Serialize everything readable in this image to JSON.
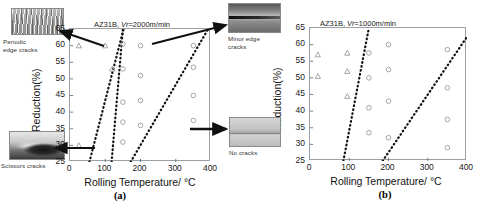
{
  "figure": {
    "panels": [
      {
        "id": "a",
        "caption": "(a)",
        "title_prefix": "AZ31B, ",
        "title_var": "Vr",
        "title_suffix": "=2000m/min",
        "title_full": "AZ31B, Vr=2000m/min"
      },
      {
        "id": "b",
        "caption": "(b)",
        "title_prefix": "AZ31B, ",
        "title_var": "Vr",
        "title_suffix": "=1000m/min",
        "title_full": "AZ31B, Vr=1000m/min"
      }
    ],
    "insets": [
      {
        "key": "periodic",
        "label": "Periodic\nedge cracks",
        "texture": "tex-periodic",
        "position": "top-left"
      },
      {
        "key": "scissors",
        "label": "Scissors cracks",
        "texture": "tex-scissors",
        "position": "bottom-left"
      },
      {
        "key": "minor",
        "label": "Minor edge\ncracks",
        "texture": "tex-minor",
        "position": "top-right"
      },
      {
        "key": "nocracks",
        "label": "No cracks",
        "texture": "tex-nocracks",
        "position": "bottom-right"
      }
    ]
  },
  "chart_data": [
    {
      "type": "scatter",
      "panel": "a",
      "title": "AZ31B, Vr=2000m/min",
      "xlabel": "Rolling Temperature/ °C",
      "ylabel": "Reduction(%)",
      "xlim": [
        0,
        400
      ],
      "ylim": [
        25,
        65
      ],
      "xticks": [
        0,
        100,
        200,
        300,
        400
      ],
      "yticks": [
        25,
        30,
        35,
        40,
        45,
        50,
        55,
        60,
        65
      ],
      "grid": false,
      "legend": "none",
      "series": [
        {
          "name": "triangle-marker",
          "marker": "triangle",
          "color": "#9b9b9b",
          "points": [
            {
              "x": 25,
              "y": 60
            },
            {
              "x": 25,
              "y": 30
            },
            {
              "x": 100,
              "y": 60
            },
            {
              "x": 120,
              "y": 53
            }
          ]
        },
        {
          "name": "circle-marker",
          "marker": "circle",
          "color": "#9b9b9b",
          "points": [
            {
              "x": 150,
              "y": 60.5
            },
            {
              "x": 150,
              "y": 53
            },
            {
              "x": 150,
              "y": 43
            },
            {
              "x": 150,
              "y": 37
            },
            {
              "x": 150,
              "y": 31
            },
            {
              "x": 200,
              "y": 60
            },
            {
              "x": 200,
              "y": 51
            },
            {
              "x": 200,
              "y": 43.5
            },
            {
              "x": 200,
              "y": 36
            },
            {
              "x": 350,
              "y": 60
            },
            {
              "x": 350,
              "y": 53.5
            },
            {
              "x": 350,
              "y": 45
            },
            {
              "x": 350,
              "y": 37.5
            }
          ]
        }
      ],
      "boundaries": [
        {
          "name": "scissors-boundary",
          "style": "dotted",
          "from": {
            "x": 55,
            "y": 25
          },
          "to": {
            "x": 152,
            "y": 65
          }
        },
        {
          "name": "periodic-boundary",
          "style": "dotted",
          "from": {
            "x": 118,
            "y": 25
          },
          "to": {
            "x": 150,
            "y": 65
          }
        },
        {
          "name": "minor-edge-boundary",
          "style": "dotted",
          "from": {
            "x": 172,
            "y": 25
          },
          "to": {
            "x": 392,
            "y": 65
          }
        }
      ]
    },
    {
      "type": "scatter",
      "panel": "b",
      "title": "AZ31B, Vr=1000m/min",
      "xlabel": "Rolling Temperature/ °C",
      "ylabel": "Reduction(%)",
      "xlim": [
        0,
        400
      ],
      "ylim": [
        25,
        65
      ],
      "xticks": [
        0,
        100,
        200,
        300,
        400
      ],
      "yticks": [
        25,
        30,
        35,
        40,
        45,
        50,
        55,
        60,
        65
      ],
      "grid": false,
      "legend": "none",
      "series": [
        {
          "name": "triangle-marker",
          "marker": "triangle",
          "color": "#9b9b9b",
          "points": [
            {
              "x": 20,
              "y": 57
            },
            {
              "x": 20,
              "y": 50.5
            },
            {
              "x": 95,
              "y": 57.5
            },
            {
              "x": 95,
              "y": 52
            },
            {
              "x": 95,
              "y": 44.5
            }
          ]
        },
        {
          "name": "circle-marker",
          "marker": "circle",
          "color": "#9b9b9b",
          "points": [
            {
              "x": 150,
              "y": 57.5
            },
            {
              "x": 150,
              "y": 50
            },
            {
              "x": 150,
              "y": 41
            },
            {
              "x": 150,
              "y": 33.5
            },
            {
              "x": 200,
              "y": 60
            },
            {
              "x": 200,
              "y": 52.5
            },
            {
              "x": 200,
              "y": 43
            },
            {
              "x": 200,
              "y": 32
            },
            {
              "x": 350,
              "y": 58.5
            },
            {
              "x": 350,
              "y": 47
            },
            {
              "x": 350,
              "y": 37.5
            },
            {
              "x": 350,
              "y": 29
            }
          ]
        }
      ],
      "boundaries": [
        {
          "name": "left-boundary",
          "style": "dotted",
          "from": {
            "x": 85,
            "y": 25
          },
          "to": {
            "x": 150,
            "y": 65
          }
        },
        {
          "name": "right-boundary",
          "style": "dotted",
          "from": {
            "x": 185,
            "y": 25
          },
          "to": {
            "x": 398,
            "y": 62
          }
        }
      ]
    }
  ]
}
